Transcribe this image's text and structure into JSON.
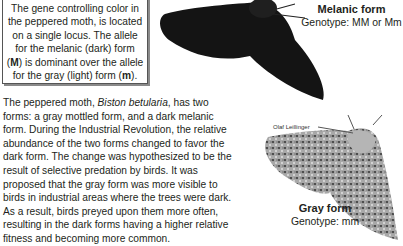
{
  "infobox": {
    "lines": [
      "The gene controlling color in",
      "the peppered moth, is located",
      "on a single locus. The allele",
      "for the melanic (dark) form",
      "is dominant over the allele",
      "for the gray (light) form"
    ],
    "allele_dominant": "M",
    "allele_recessive": "m"
  },
  "paragraph": {
    "intro": "The peppered moth, ",
    "species": "Biston betularia",
    "body": ", has two forms: a gray mottled form, and a dark melanic form. During the Industrial Revolution, the relative abundance of the two forms changed to favor the dark form. The change was hypothesized to be the result of selective predation by birds. It was proposed that the gray form was more visible to birds in industrial areas where the trees were dark. As a result, birds preyed upon them more often, resulting in the dark forms having a higher relative fitness and becoming more common."
  },
  "melanic": {
    "title": "Melanic form",
    "genotype": "Genotype: MM or Mm"
  },
  "gray": {
    "title": "Gray form",
    "genotype": "Genotype: mm"
  },
  "photo_credit": "Olaf Leillinger",
  "colors": {
    "melanic_moth": "#141414",
    "gray_moth": "#9a9a9a",
    "text": "#231f20"
  }
}
